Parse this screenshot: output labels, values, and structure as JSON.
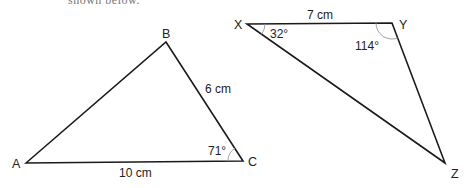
{
  "header": {
    "cut_text": "shown below."
  },
  "triangles": [
    {
      "id": "ABC",
      "vertices": {
        "A": {
          "label": "A",
          "x": 26,
          "y": 163
        },
        "B": {
          "label": "B",
          "x": 166,
          "y": 42
        },
        "C": {
          "label": "C",
          "x": 243,
          "y": 161
        }
      },
      "side_labels": {
        "AC": "10 cm",
        "BC": "6 cm"
      },
      "angle_labels": {
        "C": "71°"
      }
    },
    {
      "id": "XYZ",
      "vertices": {
        "X": {
          "label": "X",
          "x": 247,
          "y": 24
        },
        "Y": {
          "label": "Y",
          "x": 392,
          "y": 23
        },
        "Z": {
          "label": "Z",
          "x": 445,
          "y": 163
        }
      },
      "side_labels": {
        "XY": "7 cm"
      },
      "angle_labels": {
        "X": "32°",
        "Y": "114°"
      }
    }
  ],
  "colors": {
    "line": "#1a1a1a",
    "arc": "#999999",
    "text": "#222222"
  }
}
